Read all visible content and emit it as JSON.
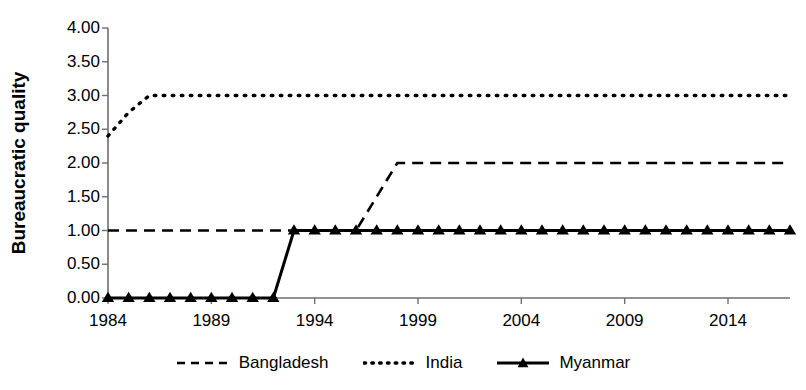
{
  "chart_data": {
    "type": "line",
    "title": "",
    "xlabel": "",
    "ylabel": "Bureaucratic quality",
    "xlim": [
      1984,
      2017
    ],
    "ylim": [
      0,
      4
    ],
    "grid": false,
    "legend_position": "bottom",
    "x": [
      1984,
      1985,
      1986,
      1987,
      1988,
      1989,
      1990,
      1991,
      1992,
      1993,
      1994,
      1995,
      1996,
      1997,
      1998,
      1999,
      2000,
      2001,
      2002,
      2003,
      2004,
      2005,
      2006,
      2007,
      2008,
      2009,
      2010,
      2011,
      2012,
      2013,
      2014,
      2015,
      2016,
      2017
    ],
    "x_tick_labels": [
      "1984",
      "1989",
      "1994",
      "1999",
      "2004",
      "2009",
      "2014"
    ],
    "x_ticks": [
      1984,
      1989,
      1994,
      1999,
      2004,
      2009,
      2014
    ],
    "y_tick_labels": [
      "0.00",
      "0.50",
      "1.00",
      "1.50",
      "2.00",
      "2.50",
      "3.00",
      "3.50",
      "4.00"
    ],
    "y_ticks": [
      0,
      0.5,
      1,
      1.5,
      2,
      2.5,
      3,
      3.5,
      4
    ],
    "series": [
      {
        "name": "Bangladesh",
        "style": "dashed",
        "marker": "none",
        "color": "#000000",
        "values": [
          1.0,
          1.0,
          1.0,
          1.0,
          1.0,
          1.0,
          1.0,
          1.0,
          1.0,
          1.0,
          1.0,
          1.0,
          1.0,
          1.5,
          2.0,
          2.0,
          2.0,
          2.0,
          2.0,
          2.0,
          2.0,
          2.0,
          2.0,
          2.0,
          2.0,
          2.0,
          2.0,
          2.0,
          2.0,
          2.0,
          2.0,
          2.0,
          2.0,
          2.0
        ]
      },
      {
        "name": "India",
        "style": "dotted",
        "marker": "none",
        "color": "#000000",
        "values": [
          2.4,
          2.75,
          3.0,
          3.0,
          3.0,
          3.0,
          3.0,
          3.0,
          3.0,
          3.0,
          3.0,
          3.0,
          3.0,
          3.0,
          3.0,
          3.0,
          3.0,
          3.0,
          3.0,
          3.0,
          3.0,
          3.0,
          3.0,
          3.0,
          3.0,
          3.0,
          3.0,
          3.0,
          3.0,
          3.0,
          3.0,
          3.0,
          3.0,
          3.0
        ]
      },
      {
        "name": "Myanmar",
        "style": "solid",
        "marker": "triangle",
        "color": "#000000",
        "values": [
          0.0,
          0.0,
          0.0,
          0.0,
          0.0,
          0.0,
          0.0,
          0.0,
          0.0,
          1.0,
          1.0,
          1.0,
          1.0,
          1.0,
          1.0,
          1.0,
          1.0,
          1.0,
          1.0,
          1.0,
          1.0,
          1.0,
          1.0,
          1.0,
          1.0,
          1.0,
          1.0,
          1.0,
          1.0,
          1.0,
          1.0,
          1.0,
          1.0,
          1.0
        ]
      }
    ]
  },
  "legend": {
    "items": [
      {
        "label": "Bangladesh",
        "style": "dashed",
        "marker": "none"
      },
      {
        "label": "India",
        "style": "dotted",
        "marker": "none"
      },
      {
        "label": "Myanmar",
        "style": "solid",
        "marker": "triangle"
      }
    ]
  },
  "axis": {
    "y_title": "Bureaucratic quality"
  }
}
